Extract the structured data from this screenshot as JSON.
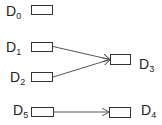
{
  "diagram": {
    "nodes": [
      {
        "id": "D0",
        "label": "D",
        "sub": "0"
      },
      {
        "id": "D1",
        "label": "D",
        "sub": "1"
      },
      {
        "id": "D2",
        "label": "D",
        "sub": "2"
      },
      {
        "id": "D3",
        "label": "D",
        "sub": "3"
      },
      {
        "id": "D4",
        "label": "D",
        "sub": "4"
      },
      {
        "id": "D5",
        "label": "D",
        "sub": "5"
      }
    ],
    "edges": [
      {
        "from": "D1",
        "to": "D3"
      },
      {
        "from": "D2",
        "to": "D3"
      },
      {
        "from": "D5",
        "to": "D4"
      }
    ],
    "colors": {
      "stroke": "#333333",
      "edge": "#555555",
      "text": "#222222"
    }
  }
}
